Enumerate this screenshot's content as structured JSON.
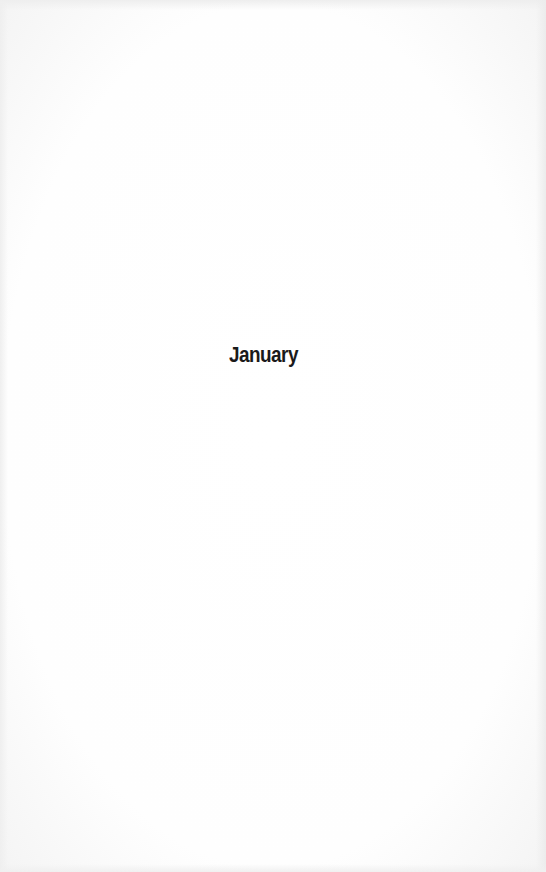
{
  "page": {
    "heading": "January"
  },
  "colors": {
    "background": "#fdfdfd",
    "text": "#1a1a1a"
  }
}
